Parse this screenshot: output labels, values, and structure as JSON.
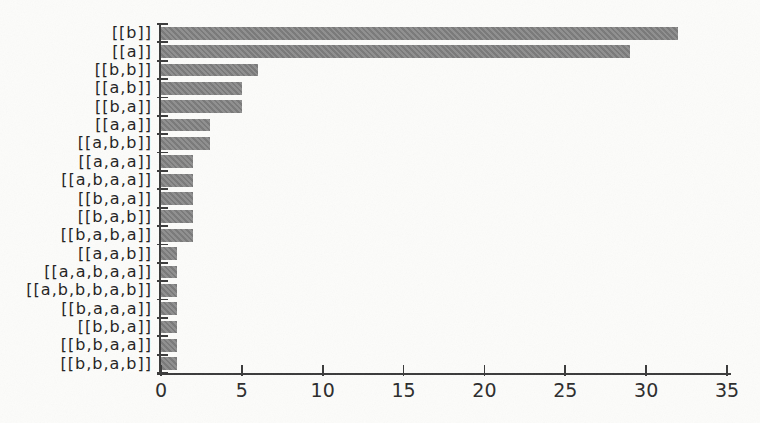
{
  "figure": {
    "background": "#fcfcfa",
    "width": 760,
    "height": 423
  },
  "chart_data": {
    "type": "bar",
    "orientation": "horizontal",
    "title": "",
    "subtitle": "",
    "xlabel": "",
    "ylabel": "",
    "grid": false,
    "legend": false,
    "xlim": [
      0,
      35
    ],
    "x_ticks": [
      0,
      5,
      10,
      15,
      20,
      25,
      30,
      35
    ],
    "bar_color": "#828282",
    "axis_color": "#3a3a3a",
    "label_color": "#1f1f1f",
    "categories": [
      "[[b]]",
      "[[a]]",
      "[[b,b]]",
      "[[a,b]]",
      "[[b,a]]",
      "[[a,a]]",
      "[[a,b,b]]",
      "[[a,a,a]]",
      "[[a,b,a,a]]",
      "[[b,a,a]]",
      "[[b,a,b]]",
      "[[b,a,b,a]]",
      "[[a,a,b]]",
      "[[a,a,b,a,a]]",
      "[[a,b,b,b,a,b]]",
      "[[b,a,a,a]]",
      "[[b,b,a]]",
      "[[b,b,a,a]]",
      "[[b,b,a,b]]"
    ],
    "values": [
      32,
      29,
      6,
      5,
      5,
      3,
      3,
      2,
      2,
      2,
      2,
      2,
      1,
      1,
      1,
      1,
      1,
      1,
      1
    ]
  }
}
